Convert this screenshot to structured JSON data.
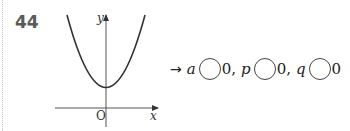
{
  "problem": {
    "number": "44",
    "arrow": "→",
    "statement": [
      {
        "var": "a",
        "rhs": "0",
        "sep": ","
      },
      {
        "var": "p",
        "rhs": "0",
        "sep": ","
      },
      {
        "var": "q",
        "rhs": "0",
        "sep": ""
      }
    ]
  },
  "graph": {
    "x_label": "x",
    "y_label": "y",
    "origin_label": "O",
    "curve": "upward-opening parabola, vertex on positive y-axis"
  }
}
